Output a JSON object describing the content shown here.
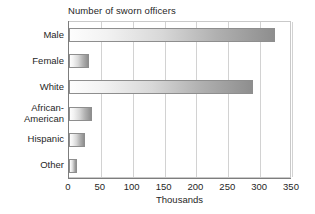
{
  "chart_data": {
    "type": "bar",
    "orientation": "horizontal",
    "title": "Number of sworn officers",
    "xlabel": "Thousands",
    "ylabel": "",
    "xlim": [
      0,
      350
    ],
    "xticks": [
      0,
      50,
      100,
      150,
      200,
      250,
      300,
      350
    ],
    "xtick_labels": [
      "0",
      "50",
      "100",
      "150",
      "200",
      "250",
      "300",
      "350"
    ],
    "grid": true,
    "legend": false,
    "categories": [
      "Male",
      "Female",
      "White",
      "African-American",
      "Hispanic",
      "Other"
    ],
    "category_labels": [
      [
        "Male"
      ],
      [
        "Female"
      ],
      [
        "White"
      ],
      [
        "African-",
        "American"
      ],
      [
        "Hispanic"
      ],
      [
        "Other"
      ]
    ],
    "values": [
      323,
      31,
      289,
      36,
      25,
      12
    ],
    "units": "thousands",
    "bar_fill_start_color": "#fdfdfd",
    "bar_fill_end_color": "#8e8e8e",
    "bar_border_color": "#8e8e8e",
    "gridline_color": "#d2d2d2",
    "axis_color": "#7d7d7d",
    "text_color": "#1f1f1f",
    "background_color": "#ffffff"
  }
}
